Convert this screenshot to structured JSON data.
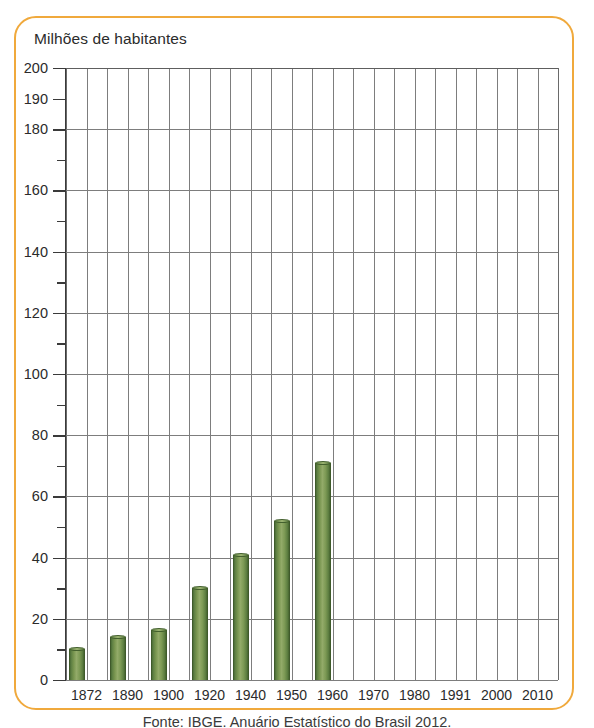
{
  "figure": {
    "border_color": "#f0a93c",
    "background": "#ffffff",
    "title": "Milhões de habitantes",
    "caption": "Fonte: IBGE. Anuário Estatístico do Brasil 2012."
  },
  "chart_data": {
    "type": "bar",
    "title": "Milhões de habitantes",
    "xlabel": "",
    "ylabel": "Milhões de habitantes",
    "categories": [
      "1872",
      "1890",
      "1900",
      "1920",
      "1940",
      "1950",
      "1960",
      "1970",
      "1980",
      "1991",
      "2000",
      "2010"
    ],
    "values": [
      10,
      14,
      16.5,
      30,
      41,
      52,
      71,
      null,
      null,
      null,
      null,
      null
    ],
    "series": [
      {
        "name": "População do Brasil (milhões de habitantes)",
        "values": [
          10,
          14,
          16.5,
          30,
          41,
          52,
          71,
          null,
          null,
          null,
          null,
          null
        ]
      }
    ],
    "ylim": [
      0,
      200
    ],
    "major_ticks": [
      0,
      20,
      40,
      60,
      80,
      100,
      120,
      140,
      160,
      180,
      190,
      200
    ],
    "minor_ticks": [
      10,
      30,
      50,
      70,
      90,
      110,
      130,
      150,
      170
    ],
    "ytick_labels": [
      "0",
      "20",
      "40",
      "60",
      "80",
      "100",
      "120",
      "140",
      "160",
      "180",
      "190",
      "200"
    ],
    "grid": "both",
    "legend": "none",
    "bar_color": "#78954f",
    "grid_color": "#7d7d7d",
    "axis_color": "#3a3a3a",
    "columns_per_category": 2,
    "bars_drawn_for": [
      "1872",
      "1890",
      "1900",
      "1920",
      "1940",
      "1950",
      "1960"
    ]
  }
}
